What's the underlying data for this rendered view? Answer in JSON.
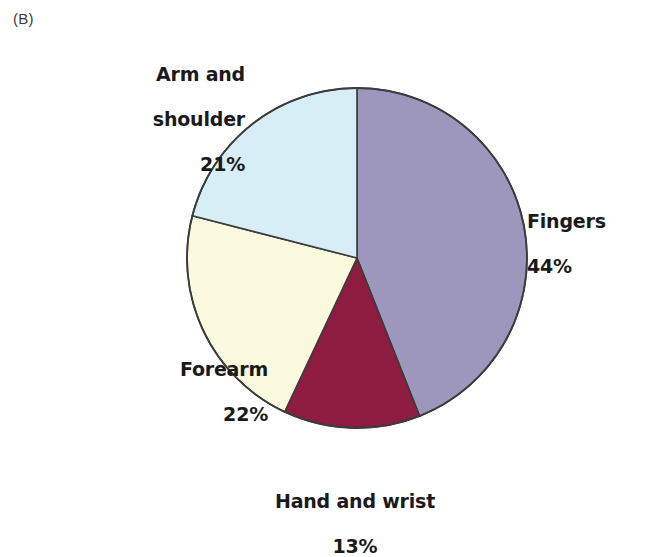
{
  "figure": {
    "panel_label": "(B)"
  },
  "chart_data": {
    "type": "pie",
    "title": "",
    "subtitle": "",
    "xlabel": "",
    "ylabel": "",
    "legend_position": "none",
    "grid": false,
    "units": "percent",
    "start_angle_deg": 0,
    "direction": "clockwise",
    "categories": [
      "Fingers",
      "Hand and wrist",
      "Forearm",
      "Arm and shoulder"
    ],
    "values": [
      44,
      13,
      22,
      21
    ],
    "colors": [
      "#9d96bd",
      "#8e1c41",
      "#fcfade",
      "#d7eef6"
    ],
    "stroke_color": "#3c3c3c",
    "slices": [
      {
        "name": "Fingers",
        "value": 44,
        "value_label": "44%",
        "label_line1": "Fingers",
        "label_line2": "44%",
        "color": "#9d96bd"
      },
      {
        "name": "Hand and wrist",
        "value": 13,
        "value_label": "13%",
        "label_line1": "Hand and wrist",
        "label_line2": "13%",
        "color": "#8e1c41"
      },
      {
        "name": "Forearm",
        "value": 22,
        "value_label": "22%",
        "label_line1": "Forearm",
        "label_line2": "22%",
        "color": "#fcfade"
      },
      {
        "name": "Arm and shoulder",
        "value": 21,
        "value_label": "21%",
        "label_line1": "Arm and",
        "label_line2": "shoulder",
        "label_line3": "21%",
        "color": "#d7eef6"
      }
    ]
  }
}
